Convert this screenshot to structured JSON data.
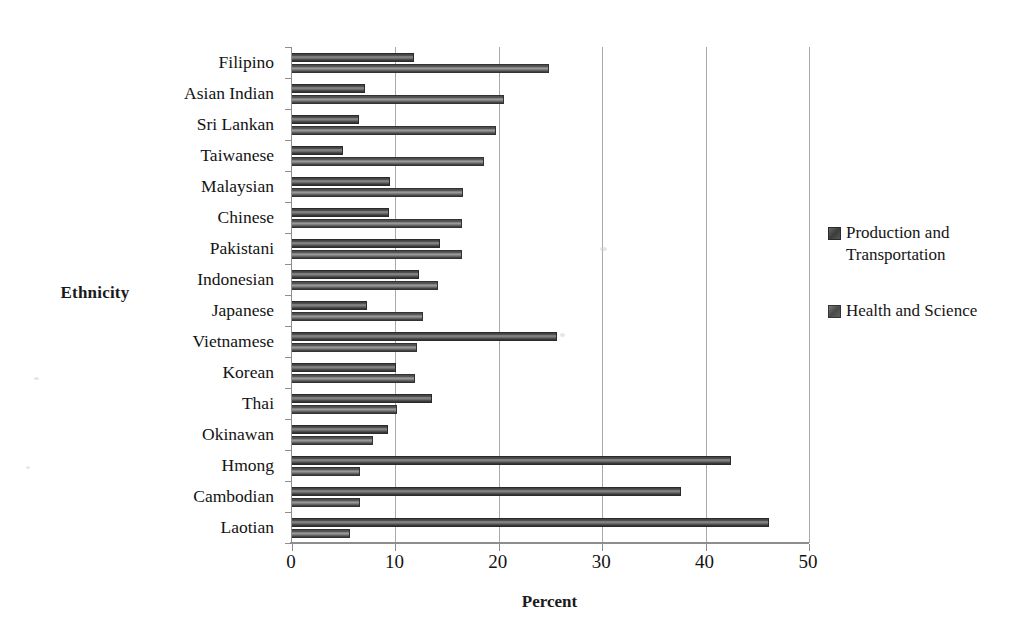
{
  "chart_data": {
    "type": "bar",
    "orientation": "horizontal",
    "title": "",
    "xlabel": "Percent",
    "ylabel": "Ethnicity",
    "xlim": [
      0,
      50
    ],
    "xticks": [
      0,
      10,
      20,
      30,
      40,
      50
    ],
    "grid": true,
    "legend_position": "right",
    "categories": [
      "Filipino",
      "Asian Indian",
      "Sri Lankan",
      "Taiwanese",
      "Malaysian",
      "Chinese",
      "Pakistani",
      "Indonesian",
      "Japanese",
      "Vietnamese",
      "Korean",
      "Thai",
      "Okinawan",
      "Hmong",
      "Cambodian",
      "Laotian"
    ],
    "series": [
      {
        "name": "Production and Transportation",
        "color": "#3c3c3c",
        "values": [
          11.8,
          7.1,
          6.5,
          4.9,
          9.5,
          9.4,
          14.3,
          12.3,
          7.3,
          25.6,
          10.1,
          13.5,
          9.3,
          42.5,
          37.6,
          46.1
        ]
      },
      {
        "name": "Health and Science",
        "color": "#4a4a4a",
        "values": [
          24.9,
          20.5,
          19.7,
          18.6,
          16.5,
          16.4,
          16.4,
          14.1,
          12.7,
          12.1,
          11.9,
          10.2,
          7.8,
          6.6,
          6.6,
          5.6
        ]
      }
    ]
  },
  "axes": {
    "y_title": "Ethnicity",
    "x_title": "Percent",
    "x_tick_labels": [
      "0",
      "10",
      "20",
      "30",
      "40",
      "50"
    ]
  },
  "legend": {
    "entries": [
      {
        "label": "Production and Transportation",
        "swatch": "legend-swatch-production"
      },
      {
        "label": "Health and Science",
        "swatch": "legend-swatch-health"
      }
    ]
  }
}
